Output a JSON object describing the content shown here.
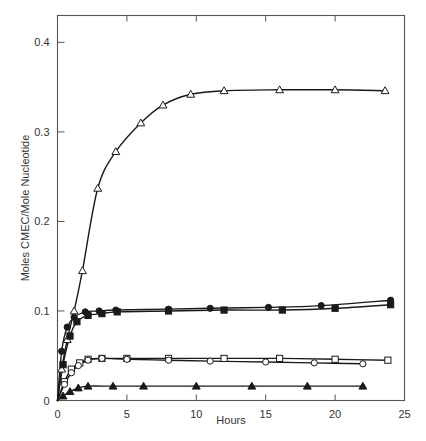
{
  "chart_data": {
    "type": "line",
    "title": "",
    "xlabel": "Hours",
    "ylabel": "Moles CMEC/Mole Nucleotide",
    "xlim": [
      0,
      25
    ],
    "ylim": [
      0,
      0.43
    ],
    "xticks": [
      0,
      5,
      10,
      15,
      20,
      25
    ],
    "xtick_labels": [
      "0",
      "5",
      "10",
      "15",
      "20",
      "25"
    ],
    "yticks": [
      0,
      0.1,
      0.2,
      0.3,
      0.4
    ],
    "ytick_labels": [
      "0",
      "0.1",
      "0.2",
      "0.3",
      "0.4"
    ],
    "grid": false,
    "legend": "none",
    "frame": "box",
    "series": [
      {
        "name": "open-triangle-upper",
        "marker": "triangle-open",
        "x": [
          0,
          0.3,
          0.7,
          1.2,
          1.8,
          2.9,
          4.2,
          6.0,
          7.6,
          9.6,
          12.0,
          16.0,
          20.0,
          23.6
        ],
        "y": [
          0.0,
          0.035,
          0.068,
          0.1,
          0.145,
          0.237,
          0.278,
          0.31,
          0.33,
          0.342,
          0.346,
          0.347,
          0.347,
          0.346
        ]
      },
      {
        "name": "filled-circle",
        "marker": "circle-filled",
        "x": [
          0,
          0.3,
          0.7,
          1.2,
          2.0,
          3.0,
          4.2,
          8.0,
          11.0,
          15.2,
          19.0,
          24.0
        ],
        "y": [
          0.0,
          0.055,
          0.082,
          0.093,
          0.099,
          0.1,
          0.101,
          0.102,
          0.103,
          0.104,
          0.106,
          0.112
        ]
      },
      {
        "name": "filled-square",
        "marker": "square-filled",
        "x": [
          0,
          0.4,
          0.9,
          1.4,
          2.2,
          3.2,
          4.3,
          8.0,
          12.0,
          16.2,
          20.0,
          24.0
        ],
        "y": [
          0.0,
          0.04,
          0.072,
          0.088,
          0.095,
          0.097,
          0.099,
          0.1,
          0.101,
          0.101,
          0.103,
          0.107
        ]
      },
      {
        "name": "open-square",
        "marker": "square-open",
        "x": [
          0,
          0.5,
          1.0,
          1.6,
          2.2,
          3.2,
          5.0,
          8.0,
          12.0,
          16.0,
          20.0,
          23.8
        ],
        "y": [
          0.0,
          0.021,
          0.035,
          0.042,
          0.046,
          0.047,
          0.047,
          0.047,
          0.047,
          0.047,
          0.046,
          0.045
        ]
      },
      {
        "name": "open-circle",
        "marker": "circle-open",
        "x": [
          0,
          0.5,
          1.0,
          1.5,
          2.2,
          3.2,
          5.0,
          8.0,
          11.0,
          15.0,
          18.5,
          22.0
        ],
        "y": [
          0.0,
          0.018,
          0.031,
          0.039,
          0.045,
          0.047,
          0.046,
          0.045,
          0.044,
          0.043,
          0.042,
          0.041
        ]
      },
      {
        "name": "filled-triangle-lower",
        "marker": "triangle-filled",
        "x": [
          0,
          0.4,
          0.9,
          1.5,
          2.2,
          4.0,
          6.2,
          10.0,
          14.0,
          18.0,
          22.0
        ],
        "y": [
          0.0,
          0.005,
          0.01,
          0.014,
          0.016,
          0.016,
          0.016,
          0.016,
          0.016,
          0.016,
          0.016
        ]
      }
    ]
  },
  "colors": {
    "ink": "#1a1a1a",
    "frame": "#555555",
    "background": "#ffffff"
  }
}
